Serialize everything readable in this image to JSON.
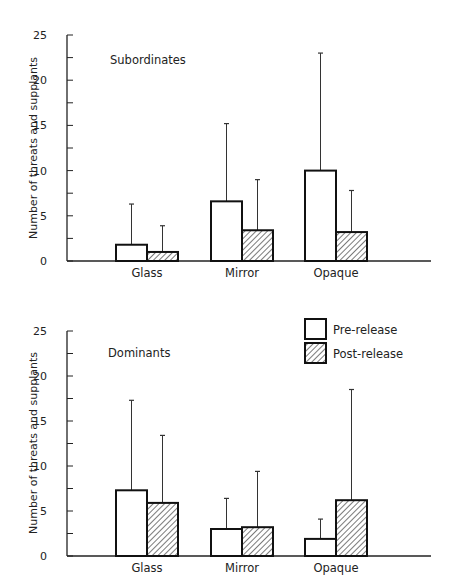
{
  "figure": {
    "ylabel": "Number of threats and supplants",
    "legend": {
      "entries": [
        {
          "label": "Pre-release",
          "pattern": "open"
        },
        {
          "label": "Post-release",
          "pattern": "hatched"
        }
      ]
    }
  },
  "chart_data": [
    {
      "type": "bar",
      "title": "Subordinates",
      "xlabel": "",
      "ylabel": "Number of threats and supplants",
      "categories": [
        "Glass",
        "Mirror",
        "Opaque"
      ],
      "ylim": [
        0,
        25
      ],
      "yticks": [
        0,
        5,
        10,
        15,
        20,
        25
      ],
      "grid": false,
      "series": [
        {
          "name": "Pre-release",
          "values": [
            1.8,
            6.6,
            10.0
          ],
          "error_upper": [
            6.3,
            15.2,
            23.0
          ]
        },
        {
          "name": "Post-release",
          "values": [
            1.0,
            3.4,
            3.2
          ],
          "error_upper": [
            3.9,
            9.0,
            7.8
          ]
        }
      ]
    },
    {
      "type": "bar",
      "title": "Dominants",
      "xlabel": "",
      "ylabel": "Number of threats and supplants",
      "categories": [
        "Glass",
        "Mirror",
        "Opaque"
      ],
      "ylim": [
        0,
        25
      ],
      "yticks": [
        0,
        5,
        10,
        15,
        20,
        25
      ],
      "grid": false,
      "legend_position": "top-right",
      "series": [
        {
          "name": "Pre-release",
          "values": [
            7.3,
            3.0,
            1.9
          ],
          "error_upper": [
            17.3,
            6.4,
            4.1
          ]
        },
        {
          "name": "Post-release",
          "values": [
            5.9,
            3.2,
            6.2
          ],
          "error_upper": [
            13.4,
            9.4,
            18.5
          ]
        }
      ]
    }
  ]
}
